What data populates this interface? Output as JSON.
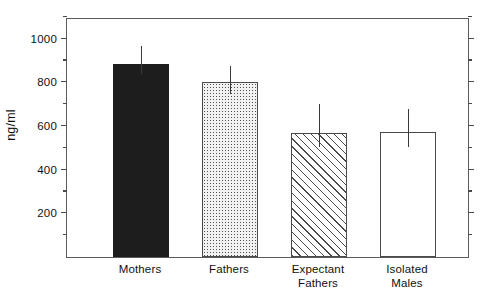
{
  "chart_data": {
    "type": "bar",
    "title": "",
    "xlabel": "",
    "ylabel": "ng/ml",
    "ylim": [
      0,
      1100
    ],
    "grid": false,
    "legend": null,
    "categories": [
      "Mothers",
      "Fathers",
      "Expectant Fathers",
      "Isolated Males"
    ],
    "category_lines": [
      [
        "Mothers"
      ],
      [
        "Fathers"
      ],
      [
        "Expectant",
        "Fathers"
      ],
      [
        "Isolated",
        "Males"
      ]
    ],
    "values": [
      885,
      800,
      570,
      575
    ],
    "errors_upper": [
      965,
      875,
      700,
      680
    ],
    "errors_lower": [
      840,
      745,
      505,
      505
    ],
    "fills": [
      "solid",
      "dotted",
      "hatched",
      "open"
    ],
    "y_major_ticks": [
      200,
      400,
      600,
      800,
      1000
    ],
    "y_minor_ticks": [
      100,
      300,
      500,
      700,
      900,
      1100
    ],
    "y_tick_labels": [
      "200",
      "400",
      "600",
      "800",
      "1000"
    ],
    "axis_color": "#4a4a4a",
    "bar_solid_color": "#1d1d1d"
  },
  "caption": {
    "text": ""
  }
}
